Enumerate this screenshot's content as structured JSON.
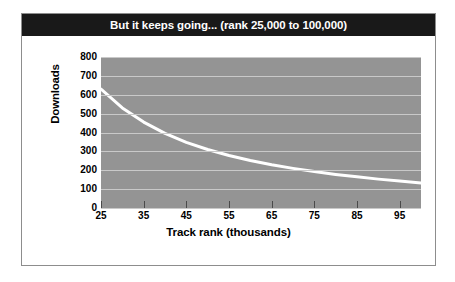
{
  "chart_data": {
    "type": "line",
    "title": "But it keeps going... (rank 25,000 to 100,000)",
    "xlabel": "Track rank (thousands)",
    "ylabel": "Downloads",
    "xlim": [
      25,
      100
    ],
    "ylim": [
      0,
      800
    ],
    "grid": true,
    "legend": "none",
    "xticks": [
      25,
      35,
      45,
      55,
      65,
      75,
      85,
      95
    ],
    "xtick_labels": [
      "25",
      "35",
      "45",
      "55",
      "65",
      "75",
      "85",
      "95"
    ],
    "yticks": [
      0,
      100,
      200,
      300,
      400,
      500,
      600,
      700,
      800
    ],
    "ytick_labels": [
      "0",
      "100",
      "200",
      "300",
      "400",
      "500",
      "600",
      "700",
      "800"
    ],
    "series": [
      {
        "name": "Downloads by track rank",
        "color": "#ffffff",
        "x": [
          25,
          30,
          35,
          40,
          45,
          50,
          55,
          60,
          65,
          70,
          75,
          80,
          85,
          90,
          95,
          100
        ],
        "values": [
          630,
          530,
          455,
          395,
          348,
          310,
          278,
          252,
          229,
          210,
          193,
          178,
          165,
          153,
          143,
          133
        ]
      }
    ],
    "colors": {
      "plot_background": "#949494",
      "gridline": "#c9c9c9",
      "line": "#ffffff",
      "title_bar": "#191919",
      "title_text": "#ffffff",
      "frame": "#8d8d8d",
      "page_background": "#ffffff"
    }
  }
}
